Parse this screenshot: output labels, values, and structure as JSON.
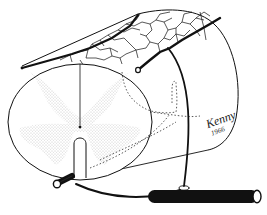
{
  "figure": {
    "signature": {
      "name": "Kenny",
      "year": "1966"
    },
    "colors": {
      "ink": "#111111",
      "background": "#ffffff",
      "stipple": "#9a9a9a"
    },
    "icons": [
      "spinal-cord-cylinder",
      "gray-matter-butterfly",
      "anterior-spinal-artery",
      "posterior-spinal-artery",
      "radicular-artery",
      "central-canal",
      "anterior-median-fissure",
      "posterior-median-sulcus",
      "pial-vessel-network",
      "segmental-artery"
    ]
  }
}
